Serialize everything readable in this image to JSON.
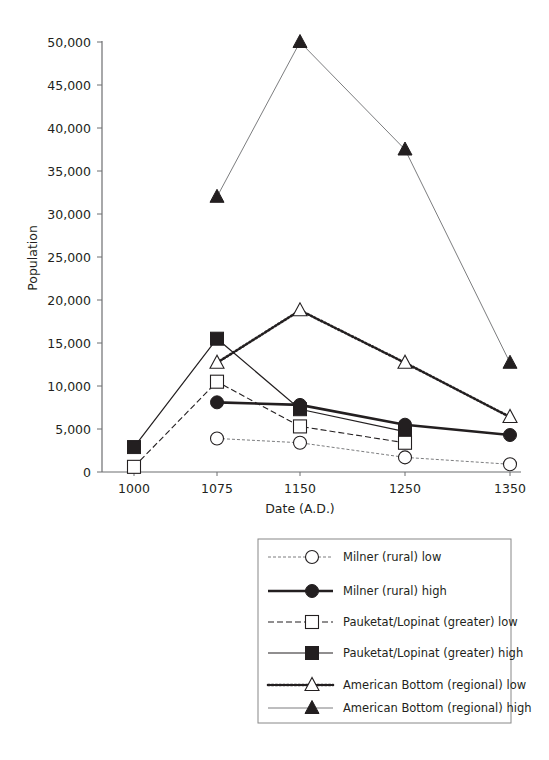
{
  "chart_data": {
    "type": "line",
    "title": "",
    "xlabel": "Date (A.D.)",
    "ylabel": "Population",
    "x": [
      1000,
      1075,
      1150,
      1250,
      1350
    ],
    "x_tick_labels": [
      "1000",
      "1075",
      "1150",
      "1250",
      "1350"
    ],
    "y_ticks": [
      0,
      5000,
      10000,
      15000,
      20000,
      25000,
      30000,
      35000,
      40000,
      45000,
      50000
    ],
    "y_tick_labels": [
      "0",
      "5,000",
      "10,000",
      "15,000",
      "20,000",
      "25,000",
      "30,000",
      "35,000",
      "40,000",
      "45,000",
      "50,000"
    ],
    "ylim": [
      0,
      50000
    ],
    "grid": false,
    "legend_position": "bottom-right, below plot",
    "series": [
      {
        "name": "Milner (rural) low",
        "line": "thin-dashed",
        "marker": "open-circle",
        "values": [
          null,
          3900,
          3400,
          1700,
          900
        ]
      },
      {
        "name": "Milner (rural) high",
        "line": "thick-solid",
        "marker": "filled-circle",
        "values": [
          null,
          8100,
          7800,
          5500,
          4300
        ]
      },
      {
        "name": "Pauketat/Lopinat (greater) low",
        "line": "dashed",
        "marker": "open-square",
        "values": [
          600,
          10500,
          5300,
          3400,
          null
        ]
      },
      {
        "name": "Pauketat/Lopinat (greater) high",
        "line": "solid",
        "marker": "filled-square",
        "values": [
          2900,
          15500,
          7300,
          4700,
          null
        ]
      },
      {
        "name": "American Bottom (regional) low",
        "line": "dotted",
        "marker": "open-triangle",
        "values": [
          null,
          12700,
          18800,
          12700,
          6400
        ]
      },
      {
        "name": "American Bottom (regional) high",
        "line": "thin-solid",
        "marker": "filled-triangle",
        "values": [
          null,
          32000,
          50000,
          37500,
          12700
        ]
      }
    ]
  },
  "legend": {
    "items": [
      {
        "label": "Milner (rural) low"
      },
      {
        "label": "Milner (rural) high"
      },
      {
        "label": "Pauketat/Lopinat (greater) low"
      },
      {
        "label": "Pauketat/Lopinat (greater) high"
      },
      {
        "label": "American Bottom (regional) low"
      },
      {
        "label": "American Bottom (regional) high"
      }
    ]
  }
}
